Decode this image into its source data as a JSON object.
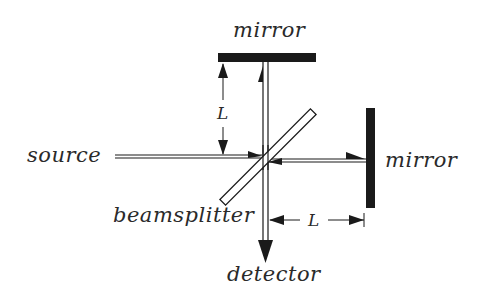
{
  "diagram": {
    "type": "Michelson interferometer",
    "labels": {
      "mirror_top": "mirror",
      "mirror_right": "mirror",
      "source": "source",
      "beamsplitter": "beamsplitter",
      "detector": "detector",
      "arm_length_vertical": "L",
      "arm_length_horizontal": "L"
    },
    "colors": {
      "ink": "#1a1a1a",
      "text": "#2a2a2a",
      "background": "#ffffff"
    }
  }
}
